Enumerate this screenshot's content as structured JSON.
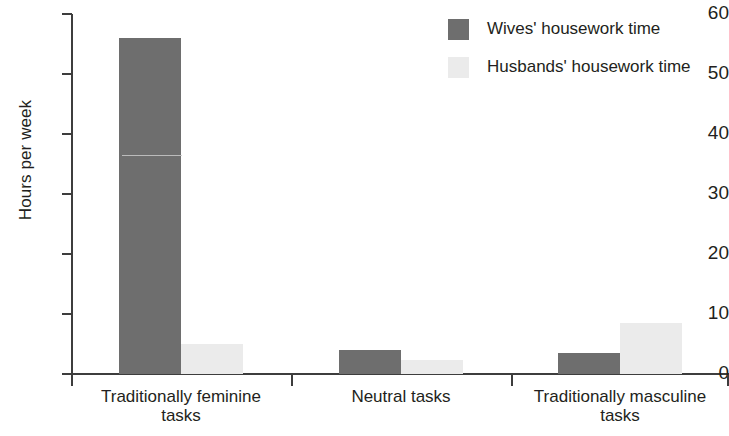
{
  "chart_data": {
    "type": "bar",
    "title": "",
    "subtitle": "",
    "xlabel": "",
    "ylabel": "Hours per week",
    "ylim": [
      0,
      60
    ],
    "yticks": [
      0,
      10,
      20,
      30,
      40,
      50,
      60
    ],
    "ytick_labels": [
      "0",
      "10",
      "20",
      "30",
      "40",
      "50",
      "60"
    ],
    "grid": false,
    "legend_position": "top-right",
    "categories": [
      "Traditionally feminine tasks",
      "Neutral tasks",
      "Traditionally masculine tasks"
    ],
    "category_lines": [
      [
        "Traditionally feminine",
        "tasks"
      ],
      [
        "Neutral tasks",
        ""
      ],
      [
        "Traditionally masculine",
        "tasks"
      ]
    ],
    "series": [
      {
        "name": "Wives' housework time",
        "color": "#6e6e6e",
        "values": [
          56,
          4,
          3.5
        ]
      },
      {
        "name": "Husbands' housework time",
        "color": "#ebebeb",
        "values": [
          5,
          2.3,
          8.5
        ]
      }
    ]
  },
  "legend": {
    "items": [
      {
        "label": "Wives' housework time",
        "color": "#6e6e6e"
      },
      {
        "label": "Husbands' housework time",
        "color": "#ebebeb"
      }
    ]
  },
  "axis": {
    "y_title": "Hours per week",
    "y_ticks": [
      "60",
      "50",
      "40",
      "30",
      "20",
      "10",
      "0"
    ]
  },
  "colors": {
    "wives": "#6e6e6e",
    "husbands": "#ebebeb",
    "axis": "#3d3d3d",
    "text": "#231f20",
    "background": "#ffffff"
  }
}
